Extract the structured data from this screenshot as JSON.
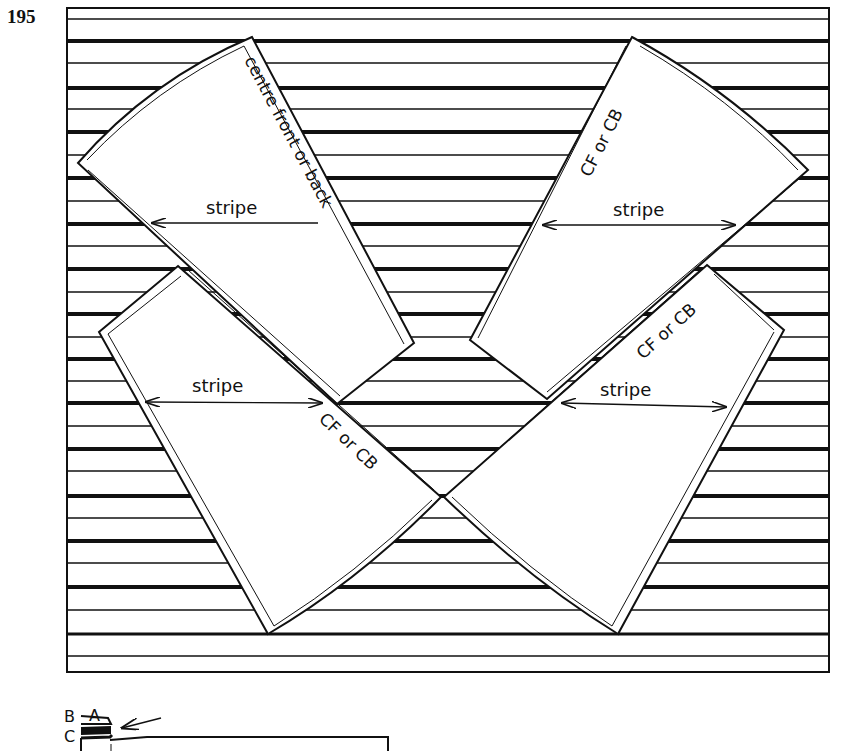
{
  "figure": {
    "number": "195"
  },
  "colors": {
    "ink": "#111111",
    "paper": "#ffffff"
  },
  "pieces": [
    {
      "id": "top-left",
      "edge_label": "centre front or back",
      "grain_label": "stripe"
    },
    {
      "id": "top-right",
      "edge_label": "CF or CB",
      "grain_label": "stripe"
    },
    {
      "id": "bottom-left",
      "edge_label": "CF or CB",
      "grain_label": "stripe"
    },
    {
      "id": "bottom-right",
      "edge_label": "CF or CB",
      "grain_label": "stripe"
    }
  ],
  "inset": {
    "labels": {
      "a": "A",
      "b": "B",
      "c": "C"
    }
  }
}
